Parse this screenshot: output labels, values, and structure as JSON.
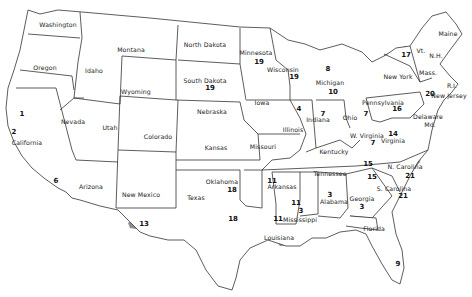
{
  "map": {
    "shade_color": "#8c8c8c",
    "border_color": "#333333",
    "background": "#ffffff",
    "states": [
      {
        "name": "Washington",
        "x": 58,
        "y": 25
      },
      {
        "name": "Oregon",
        "x": 45,
        "y": 68
      },
      {
        "name": "Idaho",
        "x": 94,
        "y": 71
      },
      {
        "name": "Montana",
        "x": 131,
        "y": 50
      },
      {
        "name": "Wyoming",
        "x": 136,
        "y": 92
      },
      {
        "name": "North Dakota",
        "x": 205,
        "y": 45
      },
      {
        "name": "South Dakota",
        "x": 205,
        "y": 81
      },
      {
        "name": "Minnesota",
        "x": 256,
        "y": 53
      },
      {
        "name": "Wisconsin",
        "x": 283,
        "y": 70
      },
      {
        "name": "Michigan",
        "x": 330,
        "y": 83
      },
      {
        "name": "Maine",
        "x": 448,
        "y": 34
      },
      {
        "name": "Vt.",
        "x": 421,
        "y": 51
      },
      {
        "name": "N.H.",
        "x": 436,
        "y": 56
      },
      {
        "name": "New York",
        "x": 398,
        "y": 77
      },
      {
        "name": "Mass.",
        "x": 428,
        "y": 73
      },
      {
        "name": "R.I.",
        "x": 452,
        "y": 86
      },
      {
        "name": "New Jersey",
        "x": 449,
        "y": 96
      },
      {
        "name": "Pennsylvania",
        "x": 383,
        "y": 103
      },
      {
        "name": "Delaware",
        "x": 428,
        "y": 117
      },
      {
        "name": "Md.",
        "x": 430,
        "y": 125
      },
      {
        "name": "Nevada",
        "x": 73,
        "y": 122
      },
      {
        "name": "Utah",
        "x": 110,
        "y": 128
      },
      {
        "name": "Colorado",
        "x": 158,
        "y": 137
      },
      {
        "name": "Nebraska",
        "x": 212,
        "y": 112
      },
      {
        "name": "Iowa",
        "x": 262,
        "y": 103
      },
      {
        "name": "Illinois",
        "x": 293,
        "y": 130
      },
      {
        "name": "Indiana",
        "x": 318,
        "y": 120
      },
      {
        "name": "Ohio",
        "x": 350,
        "y": 118
      },
      {
        "name": "W. Virginia",
        "x": 367,
        "y": 136
      },
      {
        "name": "Virginia",
        "x": 393,
        "y": 141
      },
      {
        "name": "Kentucky",
        "x": 334,
        "y": 152
      },
      {
        "name": "California",
        "x": 27,
        "y": 143
      },
      {
        "name": "Kansas",
        "x": 216,
        "y": 148
      },
      {
        "name": "Missouri",
        "x": 263,
        "y": 147
      },
      {
        "name": "Tennessee",
        "x": 330,
        "y": 174
      },
      {
        "name": "N. Carolina",
        "x": 405,
        "y": 167
      },
      {
        "name": "S. Carolina",
        "x": 394,
        "y": 189
      },
      {
        "name": "Arizona",
        "x": 91,
        "y": 187
      },
      {
        "name": "New Mexico",
        "x": 141,
        "y": 195
      },
      {
        "name": "Oklahoma",
        "x": 222,
        "y": 182
      },
      {
        "name": "Arkansas",
        "x": 282,
        "y": 187
      },
      {
        "name": "Texas",
        "x": 196,
        "y": 198
      },
      {
        "name": "Mississippi",
        "x": 300,
        "y": 220
      },
      {
        "name": "Alabama",
        "x": 334,
        "y": 202
      },
      {
        "name": "Georgia",
        "x": 362,
        "y": 199
      },
      {
        "name": "Louisiana",
        "x": 279,
        "y": 238
      },
      {
        "name": "Florida",
        "x": 374,
        "y": 229
      }
    ],
    "region_numbers": [
      {
        "value": "19",
        "x": 259,
        "y": 62
      },
      {
        "value": "19",
        "x": 210,
        "y": 88
      },
      {
        "value": "19",
        "x": 294,
        "y": 77
      },
      {
        "value": "8",
        "x": 328,
        "y": 69
      },
      {
        "value": "10",
        "x": 333,
        "y": 92
      },
      {
        "value": "17",
        "x": 406,
        "y": 55
      },
      {
        "value": "20",
        "x": 430,
        "y": 94
      },
      {
        "value": "16",
        "x": 397,
        "y": 109
      },
      {
        "value": "4",
        "x": 299,
        "y": 109
      },
      {
        "value": "7",
        "x": 323,
        "y": 114
      },
      {
        "value": "7",
        "x": 366,
        "y": 114
      },
      {
        "value": "7",
        "x": 373,
        "y": 143
      },
      {
        "value": "14",
        "x": 393,
        "y": 134
      },
      {
        "value": "1",
        "x": 22,
        "y": 114
      },
      {
        "value": "2",
        "x": 14,
        "y": 132
      },
      {
        "value": "6",
        "x": 56,
        "y": 181
      },
      {
        "value": "15",
        "x": 368,
        "y": 164
      },
      {
        "value": "21",
        "x": 410,
        "y": 176
      },
      {
        "value": "15",
        "x": 372,
        "y": 177
      },
      {
        "value": "21",
        "x": 403,
        "y": 196
      },
      {
        "value": "18",
        "x": 232,
        "y": 190
      },
      {
        "value": "18",
        "x": 233,
        "y": 219
      },
      {
        "value": "13",
        "x": 144,
        "y": 224
      },
      {
        "value": "11",
        "x": 272,
        "y": 181
      },
      {
        "value": "11",
        "x": 278,
        "y": 219
      },
      {
        "value": "11",
        "x": 296,
        "y": 203
      },
      {
        "value": "3",
        "x": 301,
        "y": 211
      },
      {
        "value": "3",
        "x": 330,
        "y": 195
      },
      {
        "value": "3",
        "x": 362,
        "y": 207
      },
      {
        "value": "9",
        "x": 398,
        "y": 264
      }
    ]
  }
}
